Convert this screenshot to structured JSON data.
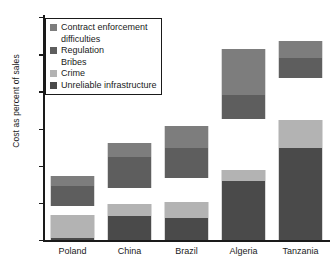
{
  "chart_data": {
    "type": "bar",
    "subtype": "stacked-bar",
    "title": "",
    "xlabel": "",
    "ylabel": "Cost as percent of sales",
    "ylim": [
      0,
      30
    ],
    "yticks": [
      0,
      5,
      10,
      15,
      20,
      25,
      30
    ],
    "ytick_labels": [
      "0",
      "5",
      "10",
      "15",
      "20",
      "25",
      "30"
    ],
    "grid": false,
    "legend_position": "top-left",
    "categories": [
      "Poland",
      "China",
      "Brazil",
      "Algeria",
      "Tanzania"
    ],
    "series": [
      {
        "name": "Unreliable infrastructure",
        "color": "#4a4a4a",
        "values": [
          0.3,
          3.2,
          3.0,
          7.9,
          12.4
        ]
      },
      {
        "name": "Crime",
        "color": "#b3b3b3",
        "values": [
          3.0,
          1.7,
          2.1,
          1.5,
          3.8
        ]
      },
      {
        "name": "Bribes",
        "color": "#ffffff",
        "values": [
          1.3,
          2.1,
          3.3,
          6.9,
          5.6
        ]
      },
      {
        "name": "Regulation",
        "color": "#5e5e5e",
        "values": [
          2.7,
          4.2,
          4.0,
          3.2,
          2.7
        ]
      },
      {
        "name": "Contract enforcement difficulties",
        "color": "#7d7d7d",
        "values": [
          1.3,
          1.8,
          2.9,
          6.2,
          2.3
        ]
      }
    ],
    "totals": [
      8.6,
      13.0,
      15.3,
      25.7,
      26.8
    ],
    "annotations": []
  },
  "legend": {
    "entries": [
      {
        "label": "Contract enforcement",
        "swatch": true,
        "indent": false
      },
      {
        "label": "difficulties",
        "swatch": false,
        "indent": true
      },
      {
        "label": "Regulation",
        "swatch": true,
        "indent": false
      },
      {
        "label": "Bribes",
        "swatch": false,
        "indent": true
      },
      {
        "label": "Crime",
        "swatch": true,
        "indent": false
      },
      {
        "label": "Unreliable infrastructure",
        "swatch": true,
        "indent": false
      }
    ]
  },
  "colors": {
    "contract_enforcement": "#7d7d7d",
    "regulation": "#5e5e5e",
    "bribes": "#ffffff",
    "crime": "#b3b3b3",
    "unreliable_infrastructure": "#4a4a4a",
    "axis": "#1a1a1a",
    "background": "#ffffff"
  }
}
